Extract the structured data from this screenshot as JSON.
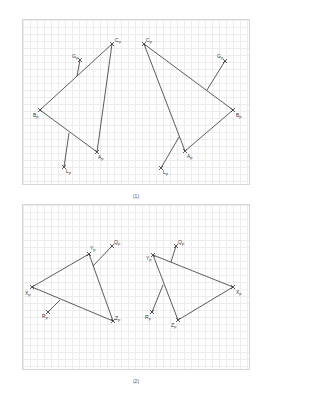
{
  "figure": {
    "panels": [
      {
        "caption": "(1)",
        "shapes": [
          {
            "name": "triangle-left",
            "vertices": [
              {
                "id": "C",
                "label": "C",
                "sub": "P",
                "x": 112,
                "y": 44,
                "lx": 115,
                "ly": 42
              },
              {
                "id": "B",
                "label": "B",
                "sub": "P",
                "x": 40,
                "y": 110,
                "lx": 33,
                "ly": 117
              },
              {
                "id": "A",
                "label": "A",
                "sub": "P",
                "x": 97,
                "y": 152,
                "lx": 98,
                "ly": 159
              }
            ],
            "extras": [
              {
                "id": "G",
                "label": "G",
                "sub": "P",
                "x": 80,
                "y": 60,
                "from": [
                  77,
                  76
                ],
                "lx": 72,
                "ly": 58
              },
              {
                "id": "L",
                "label": "L",
                "sub": "P",
                "x": 64,
                "y": 167,
                "from": [
                  69,
                  133
                ],
                "lx": 66,
                "ly": 173
              }
            ]
          },
          {
            "name": "triangle-right",
            "vertices": [
              {
                "id": "C",
                "label": "C",
                "sub": "P",
                "x": 144,
                "y": 44,
                "lx": 146,
                "ly": 42
              },
              {
                "id": "B",
                "label": "B",
                "sub": "P",
                "x": 233,
                "y": 110,
                "lx": 236,
                "ly": 117
              },
              {
                "id": "A",
                "label": "A",
                "sub": "P",
                "x": 185,
                "y": 151,
                "lx": 187,
                "ly": 158
              }
            ],
            "extras": [
              {
                "id": "G",
                "label": "G",
                "sub": "P",
                "x": 225,
                "y": 61,
                "from": [
                  207,
                  90
                ],
                "lx": 217,
                "ly": 58
              },
              {
                "id": "L",
                "label": "L",
                "sub": "P",
                "x": 161,
                "y": 168,
                "from": [
                  179,
                  137
                ],
                "lx": 163,
                "ly": 174
              }
            ]
          }
        ]
      },
      {
        "caption": "(2)",
        "shapes": [
          {
            "name": "triangle-left",
            "vertices": [
              {
                "id": "Y",
                "label": "Y",
                "sub": "P",
                "x": 89,
                "y": 254,
                "lx": 90,
                "ly": 250
              },
              {
                "id": "X",
                "label": "X",
                "sub": "P",
                "x": 32,
                "y": 287,
                "lx": 25,
                "ly": 295
              },
              {
                "id": "Z",
                "label": "Z",
                "sub": "P",
                "x": 113,
                "y": 321,
                "lx": 115,
                "ly": 320
              }
            ],
            "extras": [
              {
                "id": "Q",
                "label": "Q",
                "sub": "P",
                "x": 112,
                "y": 246,
                "from": [
                  93,
                  266
                ],
                "lx": 114,
                "ly": 244
              },
              {
                "id": "R",
                "label": "R",
                "sub": "P",
                "x": 48,
                "y": 312,
                "from": [
                  60,
                  300
                ],
                "lx": 42,
                "ly": 318
              }
            ]
          },
          {
            "name": "triangle-right",
            "vertices": [
              {
                "id": "Y",
                "label": "Y",
                "sub": "P",
                "x": 153,
                "y": 255,
                "lx": 146,
                "ly": 260
              },
              {
                "id": "X",
                "label": "X",
                "sub": "P",
                "x": 233,
                "y": 287,
                "lx": 236,
                "ly": 294
              },
              {
                "id": "Z",
                "label": "Z",
                "sub": "P",
                "x": 178,
                "y": 320,
                "lx": 171,
                "ly": 327
              }
            ],
            "extras": [
              {
                "id": "Q",
                "label": "Q",
                "sub": "P",
                "x": 176,
                "y": 246,
                "from": [
                  171,
                  262
                ],
                "lx": 178,
                "ly": 244
              },
              {
                "id": "R",
                "label": "R",
                "sub": "P",
                "x": 152,
                "y": 312,
                "from": [
                  163,
                  285
                ],
                "lx": 145,
                "ly": 319
              }
            ]
          }
        ]
      }
    ]
  },
  "colors": {
    "line": "#333333",
    "grid": "#ececec",
    "border": "#d6d6d6"
  }
}
